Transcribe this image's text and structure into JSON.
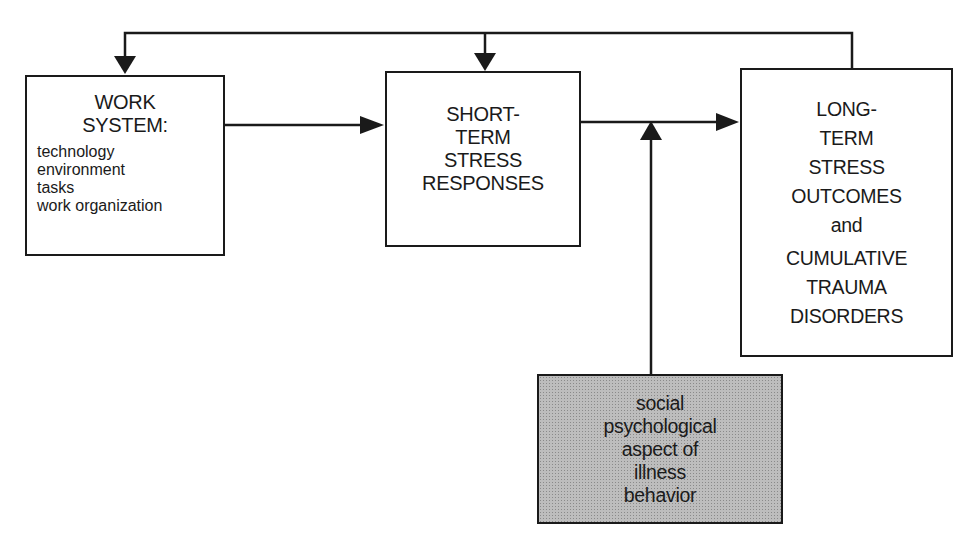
{
  "diagram": {
    "type": "flow",
    "boxes": {
      "work_system": {
        "title_lines": [
          "WORK",
          "SYSTEM:"
        ],
        "items": [
          "technology",
          "environment",
          "tasks",
          "work organization"
        ]
      },
      "short_term": {
        "title_lines": [
          "SHORT-",
          "TERM",
          "STRESS",
          "RESPONSES"
        ]
      },
      "long_term": {
        "title_lines": [
          "LONG-",
          "TERM",
          "STRESS",
          "OUTCOMES",
          "and",
          "CUMULATIVE",
          "TRAUMA",
          "DISORDERS"
        ]
      },
      "social": {
        "title_lines": [
          "social",
          "psychological",
          "aspect of",
          "illness",
          "behavior"
        ],
        "fill_color": "#bdbdbd"
      }
    },
    "edges": [
      {
        "from": "work_system",
        "to": "short_term",
        "label": ""
      },
      {
        "from": "short_term",
        "to": "long_term",
        "label": ""
      },
      {
        "from": "social",
        "to": "short_term->long_term edge",
        "label": "moderates"
      },
      {
        "from": "long_term",
        "to": "work_system",
        "label": "feedback"
      },
      {
        "from": "long_term",
        "to": "short_term",
        "label": "feedback"
      }
    ],
    "line_color": "#1a1a1a"
  }
}
